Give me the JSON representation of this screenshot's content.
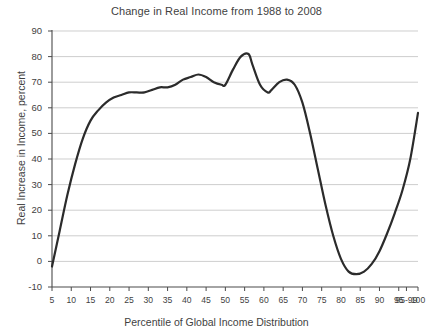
{
  "chart_data": {
    "type": "line",
    "title": "Change in Real Income from 1988 to 2008",
    "xlabel": "Percentile of Global Income Distribution",
    "ylabel": "Real Increase in Income, percent",
    "xlim": [
      5,
      100
    ],
    "ylim": [
      -10,
      90
    ],
    "grid": true,
    "legend": "none",
    "ytick_labels": [
      "90",
      "80",
      "70",
      "60",
      "50",
      "40",
      "30",
      "20",
      "10",
      "0",
      "-10"
    ],
    "ytick_values": [
      90,
      80,
      70,
      60,
      50,
      40,
      30,
      20,
      10,
      0,
      -10
    ],
    "xtick_labels": [
      "5",
      "10",
      "15",
      "20",
      "25",
      "30",
      "35",
      "40",
      "45",
      "50",
      "55",
      "60",
      "65",
      "70",
      "75",
      "80",
      "85",
      "90",
      "95",
      "95-99",
      "100"
    ],
    "xtick_values": [
      5,
      10,
      15,
      20,
      25,
      30,
      35,
      40,
      45,
      50,
      55,
      60,
      65,
      70,
      75,
      80,
      85,
      90,
      95,
      97,
      100
    ],
    "series": [
      {
        "name": "Real income growth",
        "x": [
          5,
          7,
          9,
          11,
          13,
          15,
          17,
          19,
          21,
          23,
          25,
          27,
          29,
          31,
          33,
          35,
          37,
          39,
          41,
          43,
          45,
          47,
          49,
          50,
          52,
          54,
          56,
          57,
          59,
          61,
          62,
          64,
          66,
          68,
          70,
          72,
          74,
          76,
          78,
          80,
          82,
          84,
          86,
          88,
          90,
          92,
          94,
          96,
          98,
          100
        ],
        "values": [
          -2,
          12,
          26,
          38,
          48,
          55,
          59,
          62,
          64,
          65,
          66,
          66,
          66,
          67,
          68,
          68,
          69,
          71,
          72,
          73,
          72,
          70,
          69,
          69,
          75,
          80,
          81,
          77,
          69,
          66,
          67,
          70,
          71,
          69,
          62,
          50,
          36,
          22,
          10,
          1,
          -4,
          -5,
          -4,
          -1,
          4,
          11,
          19,
          28,
          40,
          58
        ],
        "color": "#2b2b2b"
      }
    ],
    "annotations": []
  },
  "colors": {
    "background": "#ffffff",
    "grid": "#b9b9b9",
    "axis": "#4a4a4a",
    "text": "#3f3f3f",
    "curve": "#2b2b2b"
  }
}
